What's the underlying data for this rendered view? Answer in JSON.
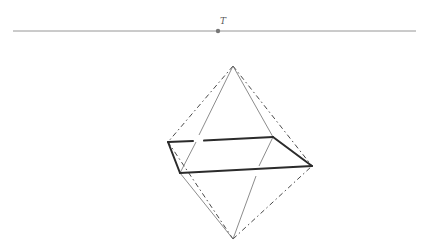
{
  "diagram": {
    "type": "geometric-figure",
    "horizontal_line": {
      "x1": 13,
      "y1": 31,
      "x2": 416,
      "y2": 31,
      "color": "#8a8a8a"
    },
    "point_t": {
      "label": "T",
      "x": 218,
      "y": 31,
      "label_x": 220,
      "label_y": 24,
      "color": "#777777"
    },
    "vertices": {
      "A": {
        "x": 233,
        "y": 66
      },
      "B": {
        "x": 233,
        "y": 239
      },
      "C": {
        "x": 168,
        "y": 142
      },
      "D": {
        "x": 180,
        "y": 173
      },
      "E": {
        "x": 312,
        "y": 166
      },
      "F": {
        "x": 273,
        "y": 137
      }
    },
    "colors": {
      "thick": "#2b2b2b",
      "thin": "#6e6e6e",
      "dashed": "#4a4a4a"
    }
  }
}
